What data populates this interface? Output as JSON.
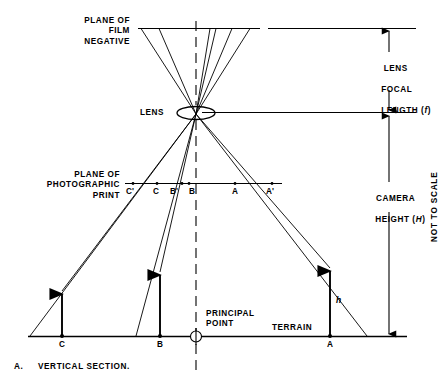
{
  "figure": {
    "caption_label": "A.",
    "caption_text": "VERTICAL SECTION.",
    "scale_note": "NOT TO SCALE"
  },
  "labels": {
    "film_plane": "PLANE OF\nFILM\nNEGATIVE",
    "lens": "LENS",
    "print_plane": "PLANE OF\nPHOTOGRAPHIC\nPRINT",
    "principal_point": "PRINCIPAL\nPOINT",
    "terrain": "TERRAIN",
    "focal_length_line1": "LENS",
    "focal_length_line2": "FOCAL",
    "focal_length_line3": "LENGTH (",
    "focal_length_symbol": "f",
    "focal_length_close": ")",
    "camera_height_line1": "CAMERA",
    "camera_height_line2": "HEIGHT (",
    "camera_height_symbol": "H",
    "camera_height_close": ")",
    "object_height_symbol": "h"
  },
  "print_points": [
    {
      "id": "C-prime",
      "label": "C'"
    },
    {
      "id": "C",
      "label": "C"
    },
    {
      "id": "B-prime",
      "label": "B'"
    },
    {
      "id": "B",
      "label": "B"
    },
    {
      "id": "A",
      "label": "A"
    },
    {
      "id": "A-prime",
      "label": "A'"
    }
  ],
  "terrain_points": [
    {
      "id": "C",
      "label": "C"
    },
    {
      "id": "B",
      "label": "B"
    },
    {
      "id": "A",
      "label": "A"
    }
  ],
  "colors": {
    "stroke": "#000000",
    "background": "#ffffff"
  }
}
